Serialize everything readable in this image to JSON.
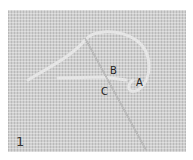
{
  "figure": {
    "step_number": "1",
    "labels": {
      "a": "A",
      "b": "B",
      "c": "C"
    },
    "colors": {
      "fabric": "#cfcfcf",
      "thread": "#e4e4e4",
      "needle": "#9a9a9a"
    }
  }
}
